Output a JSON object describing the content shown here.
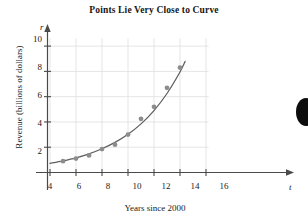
{
  "chart_data": {
    "type": "scatter",
    "title": "Points Lie Very Close to Curve",
    "xlabel": "Years since 2000",
    "ylabel": "Revenue (billions of dollars)",
    "x_var": "t",
    "y_var": "r",
    "xlim": [
      0,
      17
    ],
    "ylim": [
      0,
      11
    ],
    "xticks": [
      4,
      6,
      8,
      10,
      12,
      14,
      16
    ],
    "yticks": [
      2,
      4,
      6,
      8,
      10
    ],
    "grid": true,
    "legend": null,
    "x": [
      5,
      6,
      7,
      8,
      9,
      10,
      11,
      12,
      13,
      14
    ],
    "values": [
      0.9,
      1.1,
      1.35,
      1.85,
      2.2,
      3.0,
      4.25,
      5.2,
      6.7,
      8.3
    ],
    "series": [
      {
        "name": "Revenue data points",
        "type": "scatter",
        "x": [
          5,
          6,
          7,
          8,
          9,
          10,
          11,
          12,
          13,
          14
        ],
        "values": [
          0.9,
          1.1,
          1.35,
          1.85,
          2.2,
          3.0,
          4.25,
          5.2,
          6.7,
          8.3
        ],
        "color": "#8d8d8d"
      },
      {
        "name": "Fitted exponential curve",
        "type": "line",
        "x": [
          4.0,
          5.0,
          6.0,
          7.0,
          8.0,
          9.0,
          10.0,
          11.0,
          12.0,
          13.0,
          14.0,
          14.4
        ],
        "values": [
          0.72,
          0.92,
          1.16,
          1.48,
          1.88,
          2.38,
          3.02,
          3.85,
          4.9,
          6.25,
          7.95,
          8.8
        ],
        "color": "#5f5f5f"
      }
    ],
    "annotations": []
  },
  "axes": {
    "y_ticks": [
      {
        "label": "10",
        "value": 10
      },
      {
        "label": "8",
        "value": 8
      },
      {
        "label": "6",
        "value": 6
      },
      {
        "label": "4",
        "value": 4
      },
      {
        "label": "2",
        "value": 2
      }
    ],
    "x_ticks": [
      {
        "label": "4",
        "value": 4
      },
      {
        "label": "6",
        "value": 6
      },
      {
        "label": "8",
        "value": 8
      },
      {
        "label": "10",
        "value": 10
      },
      {
        "label": "12",
        "value": 12
      },
      {
        "label": "14",
        "value": 14
      },
      {
        "label": "16",
        "value": 16
      }
    ]
  },
  "colors": {
    "point": "#8d8d8d",
    "curve": "#5f5f5f",
    "axis": "#4a4a4a",
    "grid": "#e2e2e2",
    "text": "#1a1a1a"
  }
}
